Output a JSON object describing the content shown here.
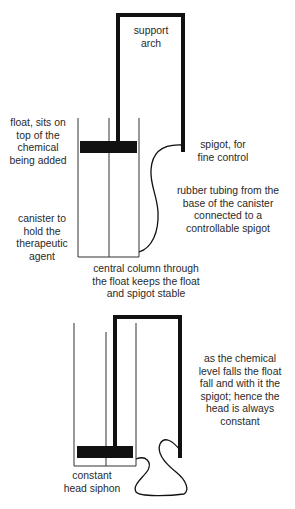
{
  "diagram": {
    "top_panel": {
      "labels": {
        "support_arch": [
          "support",
          "arch"
        ],
        "float": [
          "float, sits on",
          "top of the",
          "chemical",
          "being added"
        ],
        "spigot": [
          "spigot, for",
          "fine control"
        ],
        "rubber_tubing": [
          "rubber tubing from the",
          "base of the canister",
          "connected to a",
          "controllable spigot"
        ],
        "canister": [
          "canister to",
          "hold the",
          "therapeutic",
          "agent"
        ],
        "central_column": [
          "central column through",
          "the float keeps the float",
          "and spigot stable"
        ]
      }
    },
    "bottom_panel": {
      "labels": {
        "explanation": [
          "as the chemical",
          "level falls the float",
          "fall and with it the",
          "spigot; hence the",
          "head is always",
          "constant"
        ],
        "title": [
          "constant",
          "head siphon"
        ]
      }
    },
    "colors": {
      "line": "#111111",
      "text": "#2a2a2a",
      "background": "#ffffff"
    }
  }
}
